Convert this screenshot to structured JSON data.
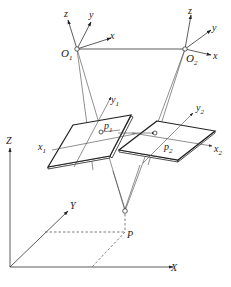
{
  "diagram": {
    "title": "",
    "type": "stereo-camera-geometry",
    "camera1": {
      "origin_label": "O",
      "origin_sub": "1",
      "axes": {
        "x": "x",
        "y": "y",
        "z": "z"
      }
    },
    "camera2": {
      "origin_label": "O",
      "origin_sub": "2",
      "axes": {
        "x": "x",
        "y": "y",
        "z": "z"
      }
    },
    "image_plane1": {
      "x_label": "x",
      "x_sub": "1",
      "y_label": "y",
      "y_sub": "1",
      "point_label": "p",
      "point_sub": "1"
    },
    "image_plane2": {
      "x_label": "x",
      "x_sub": "2",
      "y_label": "y",
      "y_sub": "2",
      "point_label": "p",
      "point_sub": "2"
    },
    "world": {
      "X": "X",
      "Y": "Y",
      "Z": "Z",
      "point": "P"
    }
  }
}
